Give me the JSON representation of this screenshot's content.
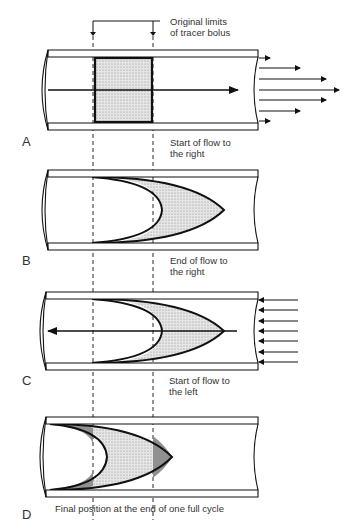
{
  "figure": {
    "bolus_label_line1": "Original limits",
    "bolus_label_line2": "of tracer bolus",
    "panels": [
      {
        "letter": "A",
        "caption_line1": "Start of flow to",
        "caption_line2": "the right"
      },
      {
        "letter": "B",
        "caption_line1": "End of flow to",
        "caption_line2": "the right"
      },
      {
        "letter": "C",
        "caption_line1": "Start of flow to",
        "caption_line2": "the left"
      },
      {
        "letter": "D",
        "caption_line1": "Final position at the end of one full cycle",
        "caption_line2": ""
      }
    ],
    "colors": {
      "stroke": "#111111",
      "fill_light": "#d8d8d8",
      "fill_dark": "#8a8a8a"
    }
  }
}
